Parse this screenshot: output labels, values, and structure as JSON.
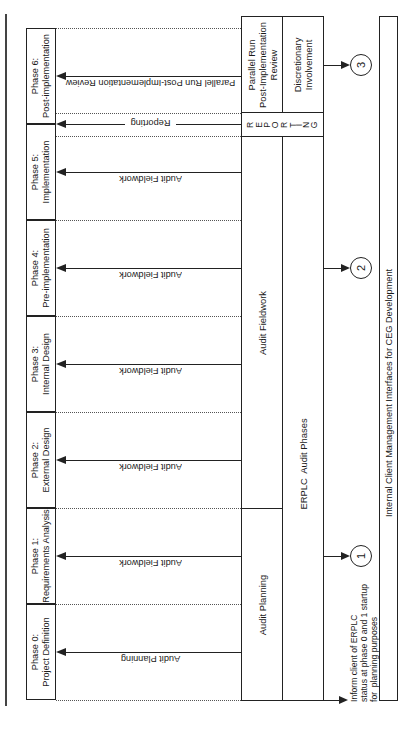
{
  "diagram": {
    "orientation": "rotated 90 degrees counter-clockwise",
    "phases": [
      {
        "id": "phase-6",
        "line1": "Phase 6:",
        "line2": "Post-implementation",
        "top": 28,
        "arrow_label": "Parallel Run Post-Implementation Review",
        "arrow_y": 76
      },
      {
        "id": "phase-5",
        "line1": "Phase 5:",
        "line2": "Implementation",
        "top": 124,
        "arrow_label": "Audit Fieldwork",
        "arrow_y": 172
      },
      {
        "id": "phase-4",
        "line1": "Phase 4:",
        "line2": "Pre-implementation",
        "top": 220,
        "arrow_label": "Audit Fieldwork",
        "arrow_y": 268
      },
      {
        "id": "phase-3",
        "line1": "Phase 3:",
        "line2": "Internal Design",
        "top": 316,
        "arrow_label": "Audit Fieldwork",
        "arrow_y": 364
      },
      {
        "id": "phase-2",
        "line1": "Phase 2:",
        "line2": "External Design",
        "top": 412,
        "arrow_label": "Audit Fieldwork",
        "arrow_y": 460
      },
      {
        "id": "phase-1",
        "line1": "Phase 1:",
        "line2": "Requirements Analysis",
        "top": 508,
        "arrow_label": "Audit Fieldwork",
        "arrow_y": 556
      },
      {
        "id": "phase-0",
        "line1": "Phase 0:",
        "line2": "Project Definition",
        "top": 604,
        "arrow_label": "Audit Planning",
        "arrow_y": 652
      }
    ],
    "reporting_arrow": {
      "label": "Reporting",
      "y": 124
    },
    "audit_boxes": {
      "parallel_run": {
        "line1": "Parallel Run",
        "line2": "Post-Implementation",
        "line3": "Review"
      },
      "discretionary": {
        "line1": "Discretionary",
        "line2": "Involvement"
      },
      "reporting_letters": [
        "R",
        "E",
        "P",
        "O",
        "R",
        "T",
        "I",
        "N",
        "G"
      ],
      "audit_fieldwork": "Audit Fieldwork",
      "audit_planning": "Audit Planning",
      "erplc_audit_phases": "ERPLC  Audit Phases"
    },
    "circles": [
      {
        "label": "3",
        "y": 65
      },
      {
        "label": "2",
        "y": 268
      },
      {
        "label": "1",
        "y": 556
      }
    ],
    "note": {
      "line1": "Inform client of ERPLC",
      "line2": "status at phase 0 and 1 startup",
      "line3": "for  planning purposes"
    },
    "ceg_box_label": "Internal Client Management Interfaces for CEG Development"
  }
}
